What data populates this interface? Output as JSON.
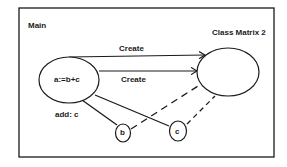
{
  "diagram": {
    "frame_label": "Main",
    "target_class_label": "Class Matrix 2",
    "source_node": {
      "label": "a:=b+c"
    },
    "edges": [
      {
        "label": "Create",
        "from": "a:=b+c",
        "to": "Class Matrix 2",
        "style": "solid-arrow"
      },
      {
        "label": "Create",
        "from": "a:=b+c",
        "to": "Class Matrix 2",
        "style": "solid-arrow"
      },
      {
        "label": "add: c",
        "from": "a:=b+c",
        "to": "b",
        "style": "solid"
      },
      {
        "label": "",
        "from": "a:=b+c",
        "to": "c",
        "style": "solid"
      },
      {
        "label": "",
        "from": "b",
        "to": "Class Matrix 2",
        "style": "dashed"
      },
      {
        "label": "",
        "from": "c",
        "to": "Class Matrix 2",
        "style": "dashed"
      }
    ],
    "nodes": [
      {
        "id": "b",
        "label": "b"
      },
      {
        "id": "c",
        "label": "c"
      }
    ],
    "colors": {
      "stroke": "#1a1a1a",
      "background": "#ffffff"
    }
  }
}
